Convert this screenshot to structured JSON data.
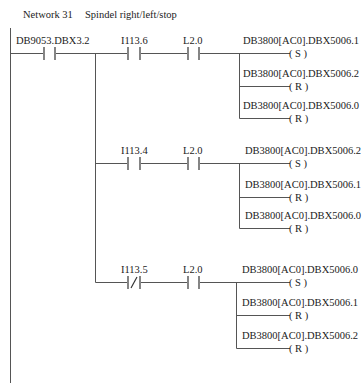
{
  "network": {
    "number": "Network 31",
    "title": "Spindel right/left/stop"
  },
  "first_contact": {
    "address": "DB9053.DBX3.2",
    "type": "NO"
  },
  "branches": [
    {
      "contacts": [
        {
          "address": "I113.6",
          "type": "NO"
        },
        {
          "address": "L2.0",
          "type": "NO"
        }
      ],
      "coils": [
        {
          "address": "DB3800[AC0].DBX5006.1",
          "type": "S",
          "label": "(  S  )"
        },
        {
          "address": "DB3800[AC0].DBX5006.2",
          "type": "R",
          "label": "(  R  )"
        },
        {
          "address": "DB3800[AC0].DBX5006.0",
          "type": "R",
          "label": "(  R  )"
        }
      ]
    },
    {
      "contacts": [
        {
          "address": "I113.4",
          "type": "NO"
        },
        {
          "address": "L2.0",
          "type": "NO"
        }
      ],
      "coils": [
        {
          "address": "DB3800[AC0].DBX5006.2",
          "type": "S",
          "label": "(  S  )"
        },
        {
          "address": "DB3800[AC0].DBX5006.1",
          "type": "R",
          "label": "(  R  )"
        },
        {
          "address": "DB3800[AC0].DBX5006.0",
          "type": "R",
          "label": "(  R  )"
        }
      ]
    },
    {
      "contacts": [
        {
          "address": "I113.5",
          "type": "NC"
        },
        {
          "address": "L2.0",
          "type": "NO"
        }
      ],
      "coils": [
        {
          "address": "DB3800[AC0].DBX5006.0",
          "type": "S",
          "label": "(  S  )"
        },
        {
          "address": "DB3800[AC0].DBX5006.1",
          "type": "R",
          "label": "(  R  )"
        },
        {
          "address": "DB3800[AC0].DBX5006.2",
          "type": "R",
          "label": "(  R  )"
        }
      ]
    }
  ]
}
